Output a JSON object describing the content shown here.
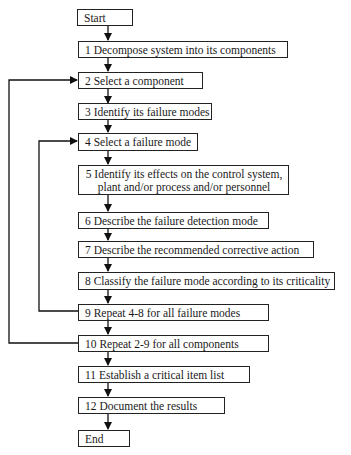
{
  "diagram": {
    "type": "flowchart",
    "steps": [
      {
        "id": "start",
        "label": "Start"
      },
      {
        "id": "s1",
        "label": "1 Decompose system into its components"
      },
      {
        "id": "s2",
        "label": "2 Select a component"
      },
      {
        "id": "s3",
        "label": "3 Identify its failure modes"
      },
      {
        "id": "s4",
        "label": "4 Select a failure mode"
      },
      {
        "id": "s5",
        "label_line1": "5 Identify its effects on the control system,",
        "label_line2": "plant and/or process and/or personnel"
      },
      {
        "id": "s6",
        "label": "6 Describe the failure detection mode"
      },
      {
        "id": "s7",
        "label": "7 Describe the recommended corrective action"
      },
      {
        "id": "s8",
        "label": "8 Classify the failure mode according to its criticality"
      },
      {
        "id": "s9",
        "label": "9 Repeat 4-8 for all failure modes"
      },
      {
        "id": "s10",
        "label": "10 Repeat 2-9 for all components"
      },
      {
        "id": "s11",
        "label": "11 Establish a critical item list"
      },
      {
        "id": "s12",
        "label": "12 Document the results"
      },
      {
        "id": "end",
        "label": "End"
      }
    ],
    "loops": [
      {
        "from": "s9",
        "to": "s4"
      },
      {
        "from": "s10",
        "to": "s2"
      }
    ]
  }
}
